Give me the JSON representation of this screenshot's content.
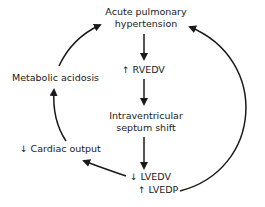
{
  "diagram": {
    "nodes": {
      "aph_line1": "Acute pulmonary",
      "aph_line2": "hypertension",
      "rvedv_symbol": "↑",
      "rvedv_label": "RVEDV",
      "septum_line1": "Intraventricular",
      "septum_line2": "septum shift",
      "lvedv_symbol": "↓",
      "lvedv_label": "LVEDV",
      "lvedp_symbol": "↑",
      "lvedp_label": "LVEDP",
      "co_symbol": "↓",
      "co_label": "Cardiac output",
      "acidosis_label": "Metabolic acidosis"
    },
    "edges": [
      {
        "from": "Acute pulmonary hypertension",
        "to": "↑ RVEDV"
      },
      {
        "from": "↑ RVEDV",
        "to": "Intraventricular septum shift"
      },
      {
        "from": "Intraventricular septum shift",
        "to": "↓ LVEDV"
      },
      {
        "from": "↓ LVEDV",
        "to": "↓ Cardiac output"
      },
      {
        "from": "↓ Cardiac output",
        "to": "Metabolic acidosis"
      },
      {
        "from": "Metabolic acidosis",
        "to": "Acute pulmonary hypertension"
      },
      {
        "from": "↑ LVEDP",
        "to": "Acute pulmonary hypertension"
      }
    ],
    "colors": {
      "ink": "#1a1a1a",
      "background": "#ffffff"
    }
  }
}
